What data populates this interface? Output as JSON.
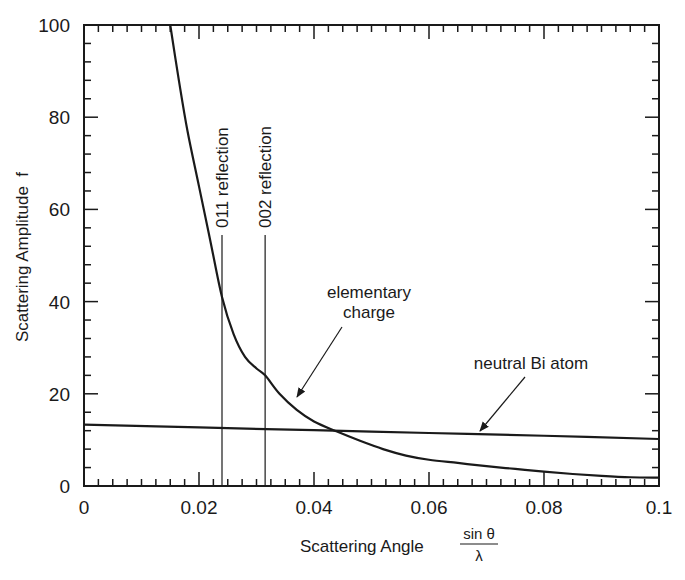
{
  "chart_data": {
    "type": "line",
    "title": "",
    "xlabel": "Scattering Angle",
    "xlabel_fraction": {
      "numerator": "sin θ",
      "denominator": "λ"
    },
    "ylabel": "Scattering Amplitude  f",
    "xlim": [
      0,
      0.1
    ],
    "ylim": [
      0,
      100
    ],
    "x_ticks": [
      0,
      0.02,
      0.04,
      0.06,
      0.08,
      0.1
    ],
    "x_tick_labels": [
      "0",
      "0.02",
      "0.04",
      "0.06",
      "0.08",
      "0.1"
    ],
    "y_ticks": [
      0,
      20,
      40,
      60,
      80,
      100
    ],
    "y_tick_labels": [
      "0",
      "20",
      "40",
      "60",
      "80",
      "100"
    ],
    "grid": false,
    "legend": null,
    "series": [
      {
        "name": "elementary charge",
        "x": [
          0.015,
          0.0165,
          0.018,
          0.02,
          0.022,
          0.024,
          0.026,
          0.028,
          0.03,
          0.0315,
          0.034,
          0.037,
          0.04,
          0.044,
          0.048,
          0.052,
          0.056,
          0.06,
          0.065,
          0.07,
          0.075,
          0.08,
          0.085,
          0.09,
          0.095,
          0.1
        ],
        "y": [
          100,
          88,
          77,
          65,
          53,
          41,
          33,
          28,
          25.5,
          24,
          20,
          16.5,
          14,
          11.8,
          9.8,
          8.0,
          6.6,
          5.7,
          5.0,
          4.3,
          3.7,
          3.1,
          2.6,
          2.2,
          1.9,
          1.8
        ]
      },
      {
        "name": "neutral Bi atom",
        "x": [
          0,
          0.02,
          0.04,
          0.06,
          0.08,
          0.1
        ],
        "y": [
          13.3,
          12.7,
          12.1,
          11.5,
          10.9,
          10.2
        ]
      }
    ],
    "vertical_markers": [
      {
        "label": "011 reflection",
        "x": 0.024
      },
      {
        "label": "002 reflection",
        "x": 0.0315
      }
    ],
    "annotations": [
      {
        "text": [
          "elementary",
          "charge"
        ],
        "points_to": {
          "x": 0.0365,
          "y": 17
        }
      },
      {
        "text": [
          "neutral Bi atom"
        ],
        "points_to": {
          "x": 0.069,
          "y": 11.3
        }
      }
    ],
    "colors": {
      "line": "#1a1a1a",
      "background": "#ffffff"
    }
  }
}
